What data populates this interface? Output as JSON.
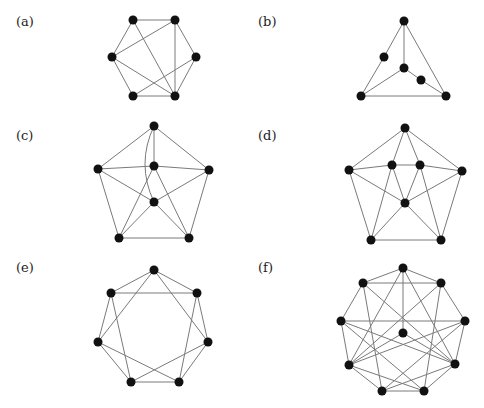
{
  "panels": [
    {
      "id": "a",
      "label": "(a)",
      "label_pos": [
        16,
        14
      ],
      "vertices": [
        [
          133,
          20
        ],
        [
          175,
          20
        ],
        [
          112,
          57
        ],
        [
          196,
          57
        ],
        [
          133,
          96
        ],
        [
          175,
          96
        ]
      ],
      "edges": [
        [
          0,
          1
        ],
        [
          0,
          2
        ],
        [
          0,
          5
        ],
        [
          1,
          2
        ],
        [
          1,
          5
        ],
        [
          1,
          3
        ],
        [
          2,
          4
        ],
        [
          2,
          5
        ],
        [
          3,
          5
        ],
        [
          3,
          4
        ],
        [
          4,
          5
        ]
      ]
    },
    {
      "id": "b",
      "label": "(b)",
      "label_pos": [
        258,
        14
      ],
      "vertices": [
        [
          404,
          21
        ],
        [
          384,
          57
        ],
        [
          404,
          68
        ],
        [
          421,
          80
        ],
        [
          361,
          96
        ],
        [
          446,
          96
        ]
      ],
      "edges": [
        [
          0,
          1
        ],
        [
          1,
          4
        ],
        [
          0,
          2
        ],
        [
          0,
          5
        ],
        [
          2,
          4
        ],
        [
          2,
          3
        ],
        [
          3,
          5
        ],
        [
          4,
          5
        ]
      ]
    },
    {
      "id": "c",
      "label": "(c)",
      "label_pos": [
        16,
        128
      ],
      "vertices": [
        [
          154,
          126
        ],
        [
          98,
          169
        ],
        [
          154,
          166
        ],
        [
          209,
          170
        ],
        [
          154,
          202
        ],
        [
          119,
          238
        ],
        [
          189,
          238
        ]
      ],
      "edges": [
        [
          0,
          1
        ],
        [
          0,
          3
        ],
        [
          0,
          2
        ],
        [
          1,
          2
        ],
        [
          2,
          3
        ],
        [
          1,
          4
        ],
        [
          3,
          4
        ],
        [
          1,
          5
        ],
        [
          3,
          6
        ],
        [
          5,
          6
        ],
        [
          2,
          5
        ],
        [
          2,
          6
        ],
        [
          4,
          5
        ],
        [
          4,
          6
        ]
      ],
      "curved_edges": [
        {
          "from": 0,
          "to": 4,
          "control": [
            136,
            164
          ]
        }
      ]
    },
    {
      "id": "d",
      "label": "(d)",
      "label_pos": [
        258,
        128
      ],
      "vertices": [
        [
          405,
          128
        ],
        [
          349,
          170
        ],
        [
          392,
          165
        ],
        [
          420,
          165
        ],
        [
          462,
          171
        ],
        [
          405,
          203
        ],
        [
          371,
          240
        ],
        [
          441,
          240
        ]
      ],
      "edges": [
        [
          0,
          1
        ],
        [
          0,
          4
        ],
        [
          0,
          2
        ],
        [
          0,
          3
        ],
        [
          1,
          2
        ],
        [
          2,
          3
        ],
        [
          3,
          4
        ],
        [
          1,
          5
        ],
        [
          4,
          5
        ],
        [
          2,
          5
        ],
        [
          3,
          5
        ],
        [
          1,
          6
        ],
        [
          4,
          7
        ],
        [
          6,
          7
        ],
        [
          2,
          6
        ],
        [
          3,
          7
        ],
        [
          5,
          6
        ],
        [
          5,
          7
        ]
      ]
    },
    {
      "id": "e",
      "label": "(e)",
      "label_pos": [
        16,
        260
      ],
      "vertices": [
        [
          154,
          270
        ],
        [
          197,
          293
        ],
        [
          208,
          342
        ],
        [
          179,
          382
        ],
        [
          131,
          382
        ],
        [
          98,
          342
        ],
        [
          111,
          293
        ]
      ],
      "edges": [
        [
          0,
          1
        ],
        [
          1,
          2
        ],
        [
          2,
          3
        ],
        [
          3,
          4
        ],
        [
          4,
          5
        ],
        [
          5,
          6
        ],
        [
          6,
          0
        ],
        [
          0,
          2
        ],
        [
          1,
          3
        ],
        [
          2,
          4
        ],
        [
          3,
          5
        ],
        [
          4,
          6
        ],
        [
          5,
          0
        ],
        [
          6,
          1
        ]
      ]
    },
    {
      "id": "f",
      "label": "(f)",
      "label_pos": [
        258,
        260
      ],
      "vertices": [
        [
          403,
          268
        ],
        [
          441,
          283
        ],
        [
          465,
          321
        ],
        [
          455,
          364
        ],
        [
          424,
          391
        ],
        [
          382,
          391
        ],
        [
          349,
          365
        ],
        [
          341,
          321
        ],
        [
          363,
          283
        ],
        [
          403,
          333
        ]
      ],
      "edges": [
        [
          0,
          1
        ],
        [
          1,
          2
        ],
        [
          2,
          3
        ],
        [
          3,
          4
        ],
        [
          4,
          5
        ],
        [
          5,
          6
        ],
        [
          6,
          7
        ],
        [
          7,
          8
        ],
        [
          8,
          0
        ],
        [
          8,
          1
        ],
        [
          7,
          2
        ],
        [
          0,
          9
        ],
        [
          0,
          6
        ],
        [
          0,
          3
        ],
        [
          1,
          6
        ],
        [
          1,
          4
        ],
        [
          8,
          3
        ],
        [
          8,
          5
        ],
        [
          7,
          3
        ],
        [
          2,
          5
        ],
        [
          2,
          6
        ],
        [
          7,
          4
        ],
        [
          9,
          6
        ],
        [
          9,
          3
        ],
        [
          4,
          6
        ],
        [
          5,
          3
        ]
      ]
    }
  ],
  "style": {
    "edge_color": "#7a7a7a",
    "vertex_color": "#111111",
    "vertex_radius": 4.5
  }
}
